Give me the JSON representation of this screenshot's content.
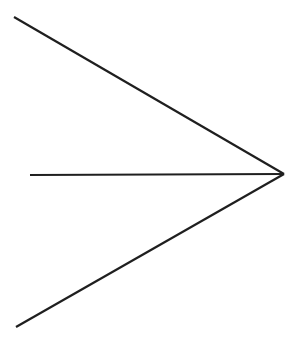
{
  "figure": {
    "kind": "line-drawing",
    "subject_name": "rightward-arrow",
    "canvas": {
      "width": 303,
      "height": 353,
      "background_color": "#ffffff"
    },
    "style": {
      "stroke_color": "#1f1f1f",
      "stroke_width": 2.2,
      "stroke_linecap": "butt",
      "fill": "none"
    },
    "vertex": {
      "name": "arrow-tip",
      "x": 284,
      "y": 174
    },
    "strokes": [
      {
        "name": "upper-barb",
        "label": "Upper barb",
        "x1": 14,
        "y1": 17,
        "x2": 284,
        "y2": 174,
        "slope": 0.58,
        "length_px": 312
      },
      {
        "name": "shaft",
        "label": "Horizontal shaft",
        "x1": 30,
        "y1": 175,
        "x2": 284,
        "y2": 174,
        "slope": 0.0,
        "length_px": 254
      },
      {
        "name": "lower-barb",
        "label": "Lower barb",
        "x1": 16,
        "y1": 327,
        "x2": 284,
        "y2": 174,
        "slope": -0.571,
        "length_px": 309
      }
    ]
  }
}
